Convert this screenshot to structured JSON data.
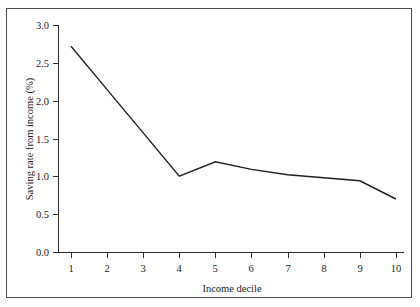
{
  "chart_data": {
    "type": "line",
    "title": "",
    "xlabel": "Income decile",
    "ylabel": "Saving rate from income (%)",
    "x": [
      1,
      2,
      3,
      4,
      5,
      6,
      7,
      8,
      9,
      10
    ],
    "categories": [
      "1",
      "2",
      "3",
      "4",
      "5",
      "6",
      "7",
      "8",
      "9",
      "10"
    ],
    "series": [
      {
        "name": "Saving rate from income",
        "values": [
          2.72,
          2.15,
          1.58,
          1.01,
          1.2,
          1.1,
          1.03,
          0.99,
          0.95,
          0.71
        ]
      }
    ],
    "xlim": [
      0.6,
      10.4
    ],
    "ylim": [
      0.0,
      3.0
    ],
    "ytick_labels": [
      "0.0",
      "0.5",
      "1.0",
      "1.5",
      "2.0",
      "2.5",
      "3.0"
    ],
    "ytick_values": [
      0.0,
      0.5,
      1.0,
      1.5,
      2.0,
      2.5,
      3.0
    ],
    "xtick_labels": [
      "1",
      "2",
      "3",
      "4",
      "5",
      "6",
      "7",
      "8",
      "9",
      "10"
    ],
    "grid": false,
    "legend": false,
    "legend_position": "none",
    "line_color": "#1f1f1f",
    "axis_color": "#2b2b2b",
    "background_color": "#ffffff",
    "border_color": "#4a4a4a"
  }
}
